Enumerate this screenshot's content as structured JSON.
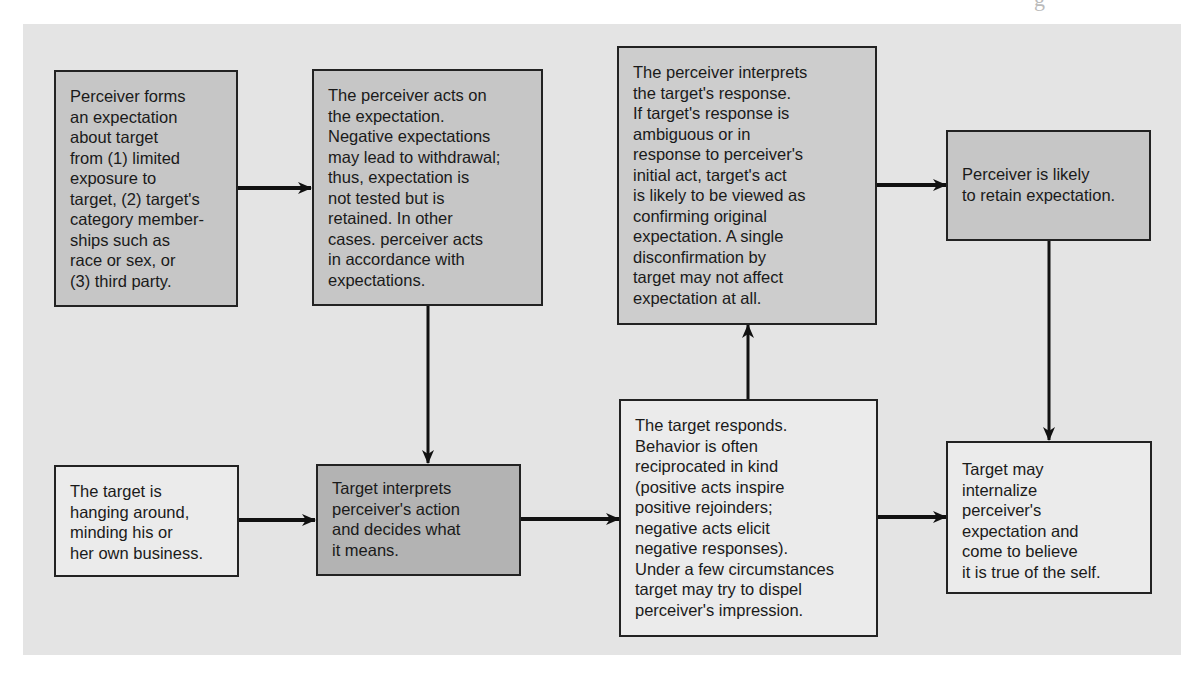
{
  "diagram": {
    "type": "flowchart",
    "topic": "Self-fulfilling prophecy / expectation confirmation process",
    "colors": {
      "panel_background": "#e4e4e4",
      "box_border": "#222222",
      "arrow": "#111111",
      "shade_mid": "#c6c6c6",
      "shade_dark": "#b3b3b3",
      "shade_light": "#ebebeb"
    },
    "nodes": [
      {
        "id": "n1",
        "text": "Perceiver forms\nan expectation\nabout target\nfrom (1) limited\nexposure to\ntarget, (2) target's\ncategory member-\nships such as\nrace or sex, or\n(3) third party."
      },
      {
        "id": "n2",
        "text": "The perceiver acts on\nthe expectation.\nNegative expectations\nmay lead to withdrawal;\nthus, expectation is\nnot tested but is\nretained. In other\ncases. perceiver acts\nin accordance with\nexpectations."
      },
      {
        "id": "n3",
        "text": "The perceiver interprets\nthe target's response.\nIf target's response is\nambiguous or in\nresponse to perceiver's\ninitial act, target's act\nis likely to be viewed as\nconfirming original\nexpectation. A single\ndisconfirmation by\ntarget may not affect\nexpectation at all."
      },
      {
        "id": "n4",
        "text": "Perceiver is likely\nto retain expectation."
      },
      {
        "id": "n5",
        "text": "The target responds.\nBehavior is often\nreciprocated in kind\n(positive acts inspire\npositive rejoinders;\nnegative acts elicit\nnegative responses).\nUnder a few circumstances\ntarget may try to dispel\nperceiver's impression."
      },
      {
        "id": "n6",
        "text": "The target is\nhanging around,\nminding his or\nher own business."
      },
      {
        "id": "n7",
        "text": "Target interprets\nperceiver's action\nand decides what\nit means."
      },
      {
        "id": "n8",
        "text": "Target may\ninternalize\nperceiver's\nexpectation and\ncome to believe\nit is true of the self."
      }
    ],
    "edges": [
      {
        "from": "n1",
        "to": "n2"
      },
      {
        "from": "n2",
        "to": "n7"
      },
      {
        "from": "n6",
        "to": "n7"
      },
      {
        "from": "n7",
        "to": "n5"
      },
      {
        "from": "n5",
        "to": "n3"
      },
      {
        "from": "n3",
        "to": "n4"
      },
      {
        "from": "n4",
        "to": "n8"
      },
      {
        "from": "n5",
        "to": "n8"
      }
    ]
  }
}
